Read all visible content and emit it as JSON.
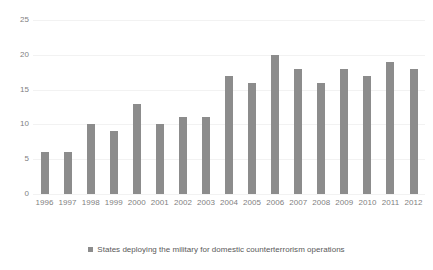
{
  "chart_data": {
    "type": "bar",
    "title": "",
    "subtitle": "",
    "xlabel": "",
    "ylabel": "",
    "categories": [
      "1996",
      "1997",
      "1998",
      "1999",
      "2000",
      "2001",
      "2002",
      "2003",
      "2004",
      "2005",
      "2006",
      "2007",
      "2008",
      "2009",
      "2010",
      "2011",
      "2012"
    ],
    "values": [
      6,
      6,
      10,
      9,
      13,
      10,
      11,
      11,
      17,
      16,
      20,
      18,
      16,
      18,
      17,
      19,
      18
    ],
    "series": [
      {
        "name": "States deploying the military for domestic counterterrorism operations",
        "values": [
          6,
          6,
          10,
          9,
          13,
          10,
          11,
          11,
          17,
          16,
          20,
          18,
          16,
          18,
          17,
          19,
          18
        ],
        "color": "#8c8c8c"
      }
    ],
    "ylim": [
      0,
      25
    ],
    "y_ticks": [
      0,
      5,
      10,
      15,
      20,
      25
    ],
    "y_tick_labels": [
      "0",
      "5",
      "10",
      "15",
      "20",
      "25"
    ],
    "grid": true,
    "grid_axis": "y",
    "grid_color": "#f2f2f2",
    "legend_position": "bottom",
    "legend_entries": [
      {
        "label": "States deploying the military for domestic counterterrorism operations",
        "marker": "square",
        "color": "#8c8c8c"
      }
    ],
    "background_color": "#ffffff",
    "tick_label_color": "#7f7f7f"
  }
}
